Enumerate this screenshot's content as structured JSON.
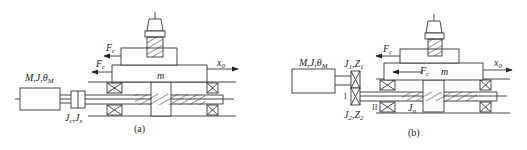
{
  "panel_a": {
    "caption": "(a)",
    "motor_label": {
      "main": "M,J,θ",
      "sub": "M"
    },
    "coupling_label": {
      "a": "J",
      "a_sub": "c",
      "sep": ",",
      "b": "J",
      "b_sub": "s"
    },
    "force_upper": {
      "main": "F",
      "sub": "c"
    },
    "force_lower": {
      "main": "F",
      "sub": "c",
      "subsub": "c"
    },
    "mass_label": "m",
    "output_label": {
      "main": "x",
      "sub": "0"
    }
  },
  "panel_b": {
    "caption": "(b)",
    "motor_label": {
      "main": "M,J,θ",
      "sub": "M"
    },
    "gear1_label": {
      "a": "J",
      "a_sub": "1",
      "sep": ",",
      "b": "Z",
      "b_sub": "1"
    },
    "gear2_label": {
      "a": "J",
      "a_sub": "2",
      "sep": ",",
      "b": "Z",
      "b_sub": "2"
    },
    "shaft_I": "I",
    "shaft_II": "II",
    "screw_inertia": {
      "main": "J",
      "sub": "n"
    },
    "force_upper": {
      "main": "F",
      "sub": "c"
    },
    "force_lower": {
      "main": "F",
      "sub": "c",
      "subsub": "c"
    },
    "mass_label": "m",
    "output_label": {
      "main": "x",
      "sub": "0"
    }
  },
  "colors": {
    "stroke": "#333333",
    "background": "#ffffff"
  }
}
